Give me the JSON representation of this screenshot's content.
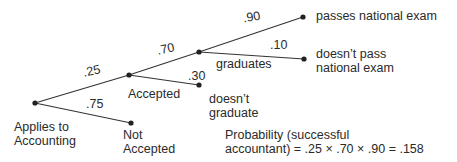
{
  "nodes": {
    "root": {
      "label_line1": "Applies to",
      "label_line2": "Accounting"
    },
    "accepted": {
      "label": "Accepted"
    },
    "not_accepted": {
      "label_line1": "Not",
      "label_line2": "Accepted"
    },
    "graduates": {
      "label": "graduates"
    },
    "doesnt_graduate": {
      "label_line1": "doesn’t",
      "label_line2": "graduate"
    },
    "passes": {
      "label": "passes national exam"
    },
    "doesnt_pass": {
      "label_line1": "doesn’t pass",
      "label_line2": "national exam"
    }
  },
  "edges": {
    "root_accepted": ".25",
    "root_not_accepted": ".75",
    "accepted_graduates": ".70",
    "accepted_doesnt_graduate": ".30",
    "graduates_passes": ".90",
    "graduates_doesnt_pass": ".10"
  },
  "formula": {
    "line1": "Probability (successful",
    "line2": "accountant) = .25 × .70 × .90 = .158"
  }
}
